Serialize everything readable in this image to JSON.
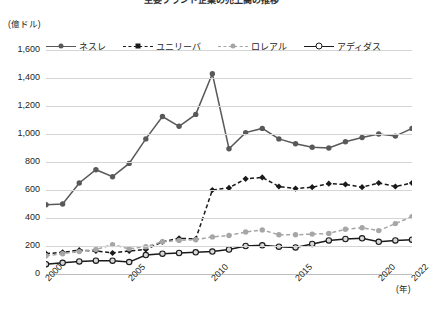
{
  "title": "主要ブランド企業の売上高の推移",
  "axes": {
    "y_unit": "(億ドル)",
    "x_unit": "(年)",
    "y_ticks": [
      "1,600",
      "1,400",
      "1,200",
      "1,000",
      "800",
      "600",
      "400",
      "200",
      "0"
    ],
    "x_ticks": [
      "2000",
      "2005",
      "2010",
      "2015",
      "2020",
      "2022"
    ]
  },
  "legend": {
    "items": [
      {
        "label": "ネスレ",
        "color": "#595959",
        "dash": "solid",
        "marker": "filled-circle"
      },
      {
        "label": "ユニリーバ",
        "color": "#1a1a1a",
        "dash": "dashed",
        "marker": "filled-diamond"
      },
      {
        "label": "ロレアル",
        "color": "#a6a6a6",
        "dash": "dashed",
        "marker": "filled-circle"
      },
      {
        "label": "アディダス",
        "color": "#1a1a1a",
        "dash": "solid",
        "marker": "hollow-circle"
      }
    ]
  },
  "chart_data": {
    "type": "line",
    "title": "主要ブランド企業の売上高の推移",
    "xlabel": "(年)",
    "ylabel": "(億ドル)",
    "ylim": [
      0,
      1600
    ],
    "xlim": [
      2000,
      2022
    ],
    "ytick_step": 200,
    "grid": true,
    "legend_position": "top",
    "x": [
      2000,
      2001,
      2002,
      2003,
      2004,
      2005,
      2006,
      2007,
      2008,
      2009,
      2010,
      2011,
      2012,
      2013,
      2014,
      2015,
      2016,
      2017,
      2018,
      2019,
      2020,
      2021,
      2022
    ],
    "series": [
      {
        "name": "ネスレ",
        "color": "#595959",
        "dash": "solid",
        "marker": "filled-circle",
        "values": [
          495,
          500,
          650,
          745,
          695,
          790,
          965,
          1125,
          1055,
          1140,
          1430,
          895,
          1010,
          1040,
          965,
          930,
          905,
          900,
          945,
          975,
          1000,
          985,
          1040
        ]
      },
      {
        "name": "ユニリーバ",
        "color": "#1a1a1a",
        "dash": "dashed",
        "marker": "filled-diamond",
        "values": [
          145,
          155,
          170,
          165,
          150,
          165,
          175,
          230,
          255,
          250,
          600,
          615,
          680,
          690,
          625,
          610,
          620,
          645,
          640,
          620,
          650,
          625,
          650
        ]
      },
      {
        "name": "ロレアル",
        "color": "#a6a6a6",
        "dash": "dashed",
        "marker": "filled-circle",
        "values": [
          130,
          145,
          160,
          175,
          210,
          180,
          195,
          230,
          240,
          245,
          265,
          275,
          300,
          315,
          280,
          280,
          285,
          290,
          320,
          330,
          310,
          360,
          410
        ]
      },
      {
        "name": "アディダス",
        "color": "#1a1a1a",
        "dash": "solid",
        "marker": "hollow-circle",
        "values": [
          70,
          80,
          90,
          95,
          95,
          85,
          135,
          145,
          150,
          155,
          160,
          175,
          200,
          205,
          195,
          190,
          215,
          240,
          250,
          255,
          230,
          240,
          245
        ]
      }
    ]
  }
}
